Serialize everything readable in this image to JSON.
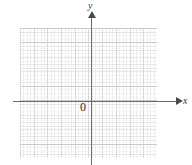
{
  "figure": {
    "type": "coordinate-plane",
    "title": ""
  },
  "axes": {
    "x": {
      "label": "x",
      "arrow": "right",
      "color": "#6b6b6b"
    },
    "y": {
      "label": "y",
      "arrow": "up",
      "color": "#6b6b6b"
    },
    "origin": {
      "label": "0"
    }
  },
  "grid": {
    "major_columns": 10,
    "major_rows": 9,
    "minor_subdivisions": 4,
    "major_color": "#c9c9c9",
    "minor_color": "#e6e6e6",
    "style": "dotted"
  },
  "chart_data": {
    "type": "scatter",
    "title": "",
    "xlabel": "x",
    "ylabel": "y",
    "x": [],
    "y": [],
    "series": [],
    "xlim": [
      -5,
      5
    ],
    "ylim": [
      -4,
      5
    ],
    "grid": true,
    "legend": "none",
    "annotations": [
      "0"
    ]
  }
}
